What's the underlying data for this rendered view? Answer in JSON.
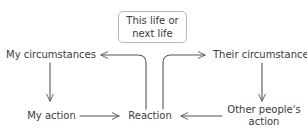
{
  "diagram": {
    "type": "flow-diagram",
    "canvas": {
      "width": 307,
      "height": 137,
      "background": "#ffffff"
    },
    "stroke_color": "#55555a",
    "text_color": "#3a3a3c",
    "box_border_color": "#b9b9bd",
    "nodes": {
      "this_life": "This life or\nnext life",
      "this_life_line1": "This life or",
      "this_life_line2": "next life",
      "my_circumstances": "My circumstances",
      "their_circumstances": "Their circumstances",
      "my_action": "My action",
      "reaction": "Reaction",
      "other_peoples_action_line1": "Other people's",
      "other_peoples_action_line2": "action"
    },
    "edges": [
      {
        "id": "my-circumstances-to-my-action",
        "from": "my_circumstances",
        "to": "my_action",
        "direction": "down",
        "shape": "straight"
      },
      {
        "id": "my-action-to-reaction",
        "from": "my_action",
        "to": "reaction",
        "direction": "right",
        "shape": "straight"
      },
      {
        "id": "their-circumstances-to-other-peoples-action",
        "from": "their_circumstances",
        "to": "other_peoples_action",
        "direction": "down",
        "shape": "straight"
      },
      {
        "id": "other-peoples-action-to-reaction",
        "from": "other_peoples_action",
        "to": "reaction",
        "direction": "left",
        "shape": "straight"
      },
      {
        "id": "reaction-to-my-circumstances",
        "from": "reaction",
        "to": "my_circumstances",
        "direction": "left",
        "shape": "elbow-curved"
      },
      {
        "id": "reaction-to-their-circumstances",
        "from": "reaction",
        "to": "their_circumstances",
        "direction": "right",
        "shape": "elbow-curved"
      }
    ]
  }
}
